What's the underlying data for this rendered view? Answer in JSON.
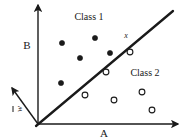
{
  "figure": {
    "title": "",
    "background_color": "#ffffff",
    "ink_color": "#1a1a1a",
    "width": 187,
    "height": 138
  },
  "labels": {
    "class1": "Class 1",
    "class2": "Class 2",
    "axis_horizontal": "A",
    "axis_vertical": "B",
    "weight_vector": "w",
    "sample_point": "x"
  },
  "chart_data": {
    "type": "scatter",
    "title": "",
    "xlabel": "A",
    "ylabel": "B",
    "xlim": [
      0,
      187
    ],
    "ylim": [
      0,
      138
    ],
    "grid": false,
    "legend": "inline-annotations",
    "annotations": [
      {
        "text": "Class 1",
        "x": 89,
        "y": 17
      },
      {
        "text": "Class 2",
        "x": 145,
        "y": 73
      },
      {
        "text": "A",
        "x": 104,
        "y": 133
      },
      {
        "text": "B",
        "x": 27,
        "y": 45
      },
      {
        "text": "x",
        "x": 126,
        "y": 36
      },
      {
        "text": "w",
        "x": 19,
        "y": 109
      }
    ],
    "axes": [
      {
        "name": "vertical-axis-B",
        "x1": 38,
        "y1": 124,
        "x2": 38,
        "y2": 5,
        "arrow": true
      },
      {
        "name": "horizontal-axis-A",
        "x1": 38,
        "y1": 124,
        "x2": 178,
        "y2": 124,
        "arrow": true
      },
      {
        "name": "weight-vector-w",
        "x1": 38,
        "y1": 124,
        "x2": 12,
        "y2": 88,
        "arrow": true
      }
    ],
    "decision_boundary": {
      "x1": 36,
      "y1": 126,
      "x2": 173,
      "y2": 11
    },
    "series": [
      {
        "name": "Class 1",
        "marker": "filled-circle",
        "color": "#1a1a1a",
        "points": [
          [
            62,
            43
          ],
          [
            80,
            58
          ],
          [
            95,
            38
          ],
          [
            110,
            53
          ],
          [
            61,
            83
          ]
        ]
      },
      {
        "name": "Class 2",
        "marker": "open-circle",
        "color": "#1a1a1a",
        "points": [
          [
            130,
            52
          ],
          [
            106,
            72
          ],
          [
            85,
            95
          ],
          [
            114,
            100
          ],
          [
            142,
            92
          ],
          [
            152,
            110
          ]
        ]
      }
    ]
  }
}
